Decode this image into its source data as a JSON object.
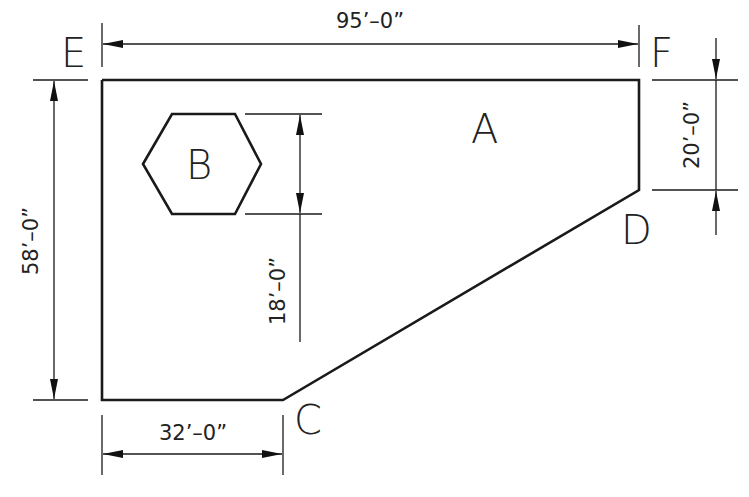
{
  "diagram": {
    "labels": {
      "A": "A",
      "B": "B",
      "C": "C",
      "D": "D",
      "E": "E",
      "F": "F"
    },
    "dimensions": {
      "top": "95’–0”",
      "left": "58’–0”",
      "bottom": "32’–0”",
      "right": "20’–0”",
      "hexagon": "18’–0”"
    },
    "shapes": {
      "parcel": "polygon E-F-D-C with region A",
      "hexagon": "region B"
    }
  }
}
